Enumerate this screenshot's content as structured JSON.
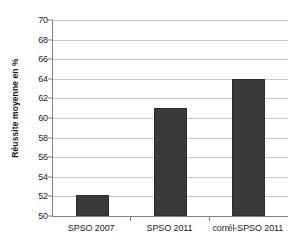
{
  "chart_data": {
    "type": "bar",
    "title": "",
    "xlabel": "",
    "ylabel": "Réussite moyenne en %",
    "categories": [
      "SPSO 2007",
      "SPSO 2011",
      "corrél-SPSO 2011"
    ],
    "values": [
      52.1,
      61.0,
      64.0
    ],
    "ylim": [
      50,
      70
    ],
    "ytick_step": 2,
    "yticks": [
      70,
      68,
      66,
      64,
      62,
      60,
      58,
      56,
      54,
      52,
      50
    ],
    "ytick_labels": [
      "70",
      "68",
      "66",
      "64",
      "62",
      "60",
      "58",
      "56",
      "54",
      "52",
      "50"
    ],
    "grid": true,
    "grid_axis": "y",
    "legend": false,
    "legend_position": "none",
    "series": [
      {
        "name": "Réussite moyenne en %",
        "values": [
          52.1,
          61.0,
          64.0
        ],
        "color": "#3a3a3a"
      }
    ],
    "colors": {
      "bar_fill": "#3a3a3a",
      "bar_border": "#2d2d2d",
      "gridline": "#c6c6c6",
      "axis": "#808080",
      "text": "#1a1a1a",
      "background": "#ffffff"
    }
  }
}
